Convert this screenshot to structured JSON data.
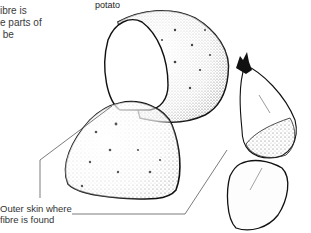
{
  "caption": {
    "text": "ibre is\ne parts of\n be"
  },
  "labels": {
    "potato": "potato",
    "wheat": "wheat",
    "outer_skin": "Outer skin where\nfibre is found"
  },
  "colors": {
    "ink": "#1a1a1a",
    "stipple": "#555555",
    "background": "#ffffff"
  }
}
